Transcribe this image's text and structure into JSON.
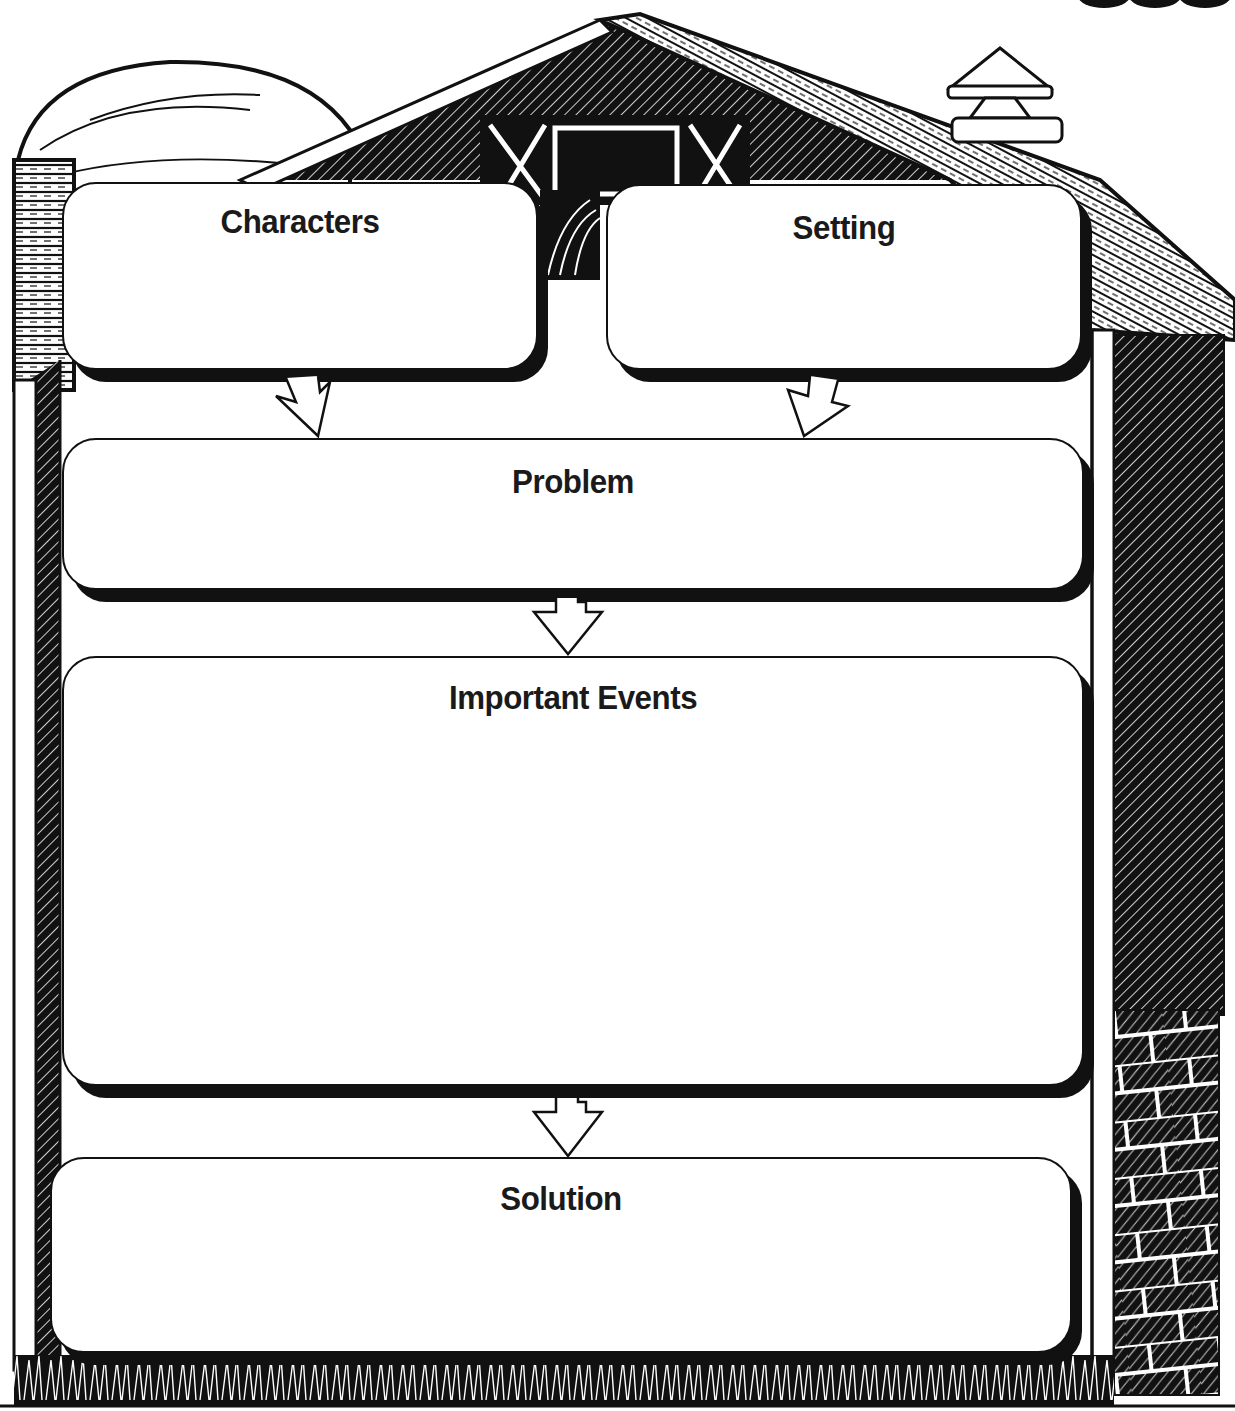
{
  "worksheet": {
    "theme": "barn story map",
    "boxes": [
      {
        "id": "characters",
        "label": "Characters"
      },
      {
        "id": "setting",
        "label": "Setting"
      },
      {
        "id": "problem",
        "label": "Problem"
      },
      {
        "id": "important_events",
        "label": "Important Events"
      },
      {
        "id": "solution",
        "label": "Solution"
      }
    ],
    "arrows": [
      {
        "from": "Characters",
        "to": "Problem"
      },
      {
        "from": "Setting",
        "to": "Problem"
      },
      {
        "from": "Problem",
        "to": "Important Events"
      },
      {
        "from": "Important Events",
        "to": "Solution"
      }
    ]
  },
  "colors": {
    "ink": "#111111",
    "paper": "#ffffff"
  }
}
